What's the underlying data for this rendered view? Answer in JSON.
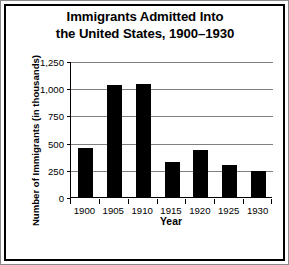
{
  "chart_data": {
    "type": "bar",
    "title": "Immigrants Admitted Into the United States, 1900–1930",
    "title_line1": "Immigrants Admitted Into",
    "title_line2": "the United States, 1900–1930",
    "xlabel": "Year",
    "ylabel": "Number of Immigrants (in thousands)",
    "categories": [
      "1900",
      "1905",
      "1910",
      "1915",
      "1920",
      "1925",
      "1930"
    ],
    "values": [
      450,
      1025,
      1040,
      325,
      430,
      295,
      240
    ],
    "ylim": [
      0,
      1250
    ],
    "ytick_values": [
      0,
      250,
      500,
      750,
      1000,
      1250
    ],
    "ytick_labels": [
      "0",
      "250",
      "500",
      "750",
      "1,000",
      "1,250"
    ],
    "grid": true,
    "legend": false,
    "bar_color": "#000000",
    "grid_color": "#808080",
    "axis_color": "#000000",
    "background_color": "#ffffff"
  }
}
